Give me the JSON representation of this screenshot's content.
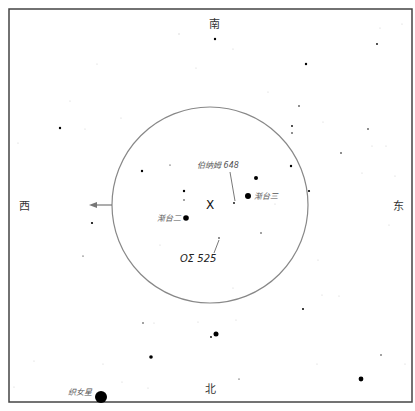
{
  "directions": {
    "south": "南",
    "north": "北",
    "west": "西",
    "east": "东"
  },
  "center_marker": "X",
  "labels": {
    "bernham": "伯纳姆 648",
    "os525": "ΟΣ 525",
    "jiantai2": "渐台二",
    "jiantai3": "渐台三",
    "vega": "织女星"
  },
  "field_circle": {
    "cx": 210,
    "cy": 205,
    "r": 98,
    "color": "#888888"
  },
  "frame": {
    "x": 9,
    "y": 9,
    "width": 403,
    "height": 393
  },
  "stars": [
    {
      "x": 215,
      "y": 39,
      "r": 1.2
    },
    {
      "x": 306,
      "y": 64,
      "r": 1.2
    },
    {
      "x": 377,
      "y": 44,
      "r": 0.9
    },
    {
      "x": 60,
      "y": 128,
      "r": 1.2
    },
    {
      "x": 299,
      "y": 106,
      "r": 0.8
    },
    {
      "x": 292,
      "y": 133,
      "r": 0.8
    },
    {
      "x": 368,
      "y": 129,
      "r": 0.8
    },
    {
      "x": 341,
      "y": 153,
      "r": 0.8
    },
    {
      "x": 184,
      "y": 191,
      "r": 1.2
    },
    {
      "x": 184,
      "y": 200,
      "r": 0.7
    },
    {
      "x": 170,
      "y": 165,
      "r": 0.6
    },
    {
      "x": 142,
      "y": 171,
      "r": 1.2
    },
    {
      "x": 256,
      "y": 178,
      "r": 2.0
    },
    {
      "x": 248,
      "y": 196,
      "r": 3.0
    },
    {
      "x": 186,
      "y": 218,
      "r": 2.8
    },
    {
      "x": 234,
      "y": 203,
      "r": 0.9
    },
    {
      "x": 292,
      "y": 126,
      "r": 0.9
    },
    {
      "x": 291,
      "y": 166,
      "r": 1.2
    },
    {
      "x": 309,
      "y": 191,
      "r": 1.1
    },
    {
      "x": 261,
      "y": 233,
      "r": 0.7
    },
    {
      "x": 219,
      "y": 238,
      "r": 0.8
    },
    {
      "x": 92,
      "y": 223,
      "r": 1.1
    },
    {
      "x": 83,
      "y": 256,
      "r": 0.6
    },
    {
      "x": 303,
      "y": 309,
      "r": 1.0
    },
    {
      "x": 143,
      "y": 323,
      "r": 0.7
    },
    {
      "x": 216,
      "y": 334,
      "r": 2.5
    },
    {
      "x": 211,
      "y": 337,
      "r": 0.9
    },
    {
      "x": 151,
      "y": 357,
      "r": 1.8
    },
    {
      "x": 381,
      "y": 355,
      "r": 0.7
    },
    {
      "x": 239,
      "y": 379,
      "r": 0.6
    },
    {
      "x": 361,
      "y": 379,
      "r": 2.4
    },
    {
      "x": 101,
      "y": 397,
      "r": 6.0
    }
  ]
}
